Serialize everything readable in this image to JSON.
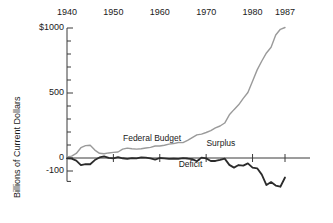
{
  "chart_data": {
    "type": "line",
    "title": "",
    "subtitle": "",
    "xlabel": "",
    "ylabel": "Billions of Current Dollars",
    "xlim": [
      1940,
      1987
    ],
    "ylim": [
      -180,
      1000
    ],
    "grid": false,
    "legend_position": "inline-annotations",
    "x_ticks": [
      {
        "value": 1940,
        "label": "1940"
      },
      {
        "value": 1950,
        "label": "1950"
      },
      {
        "value": 1960,
        "label": "1960"
      },
      {
        "value": 1970,
        "label": "1970"
      },
      {
        "value": 1980,
        "label": "1980"
      },
      {
        "value": 1987,
        "label": "1987"
      }
    ],
    "x_tick_side": "top",
    "y_ticks": [
      {
        "value": 1000,
        "label": "$1000",
        "major": true
      },
      {
        "value": 900,
        "label": "",
        "major": false
      },
      {
        "value": 800,
        "label": "",
        "major": false
      },
      {
        "value": 700,
        "label": "",
        "major": false
      },
      {
        "value": 600,
        "label": "",
        "major": false
      },
      {
        "value": 500,
        "label": "500",
        "major": true
      },
      {
        "value": 400,
        "label": "",
        "major": false
      },
      {
        "value": 300,
        "label": "",
        "major": false
      },
      {
        "value": 200,
        "label": "",
        "major": false
      },
      {
        "value": 100,
        "label": "",
        "major": false
      },
      {
        "value": 0,
        "label": "0",
        "major": true
      },
      {
        "value": -100,
        "label": "-100",
        "major": true
      },
      {
        "value": -180,
        "label": "",
        "major": false
      }
    ],
    "colors": {
      "federal_budget": "#9a9a9a",
      "surplus_deficit": "#2b2b2b",
      "axis": "#3a3a3a",
      "text": "#1a1a1a"
    },
    "annotations": [
      {
        "text": "Federal Budget",
        "x": 1952.5,
        "y": 150,
        "series": "federal_budget"
      },
      {
        "text": "Surplus",
        "x": 1970.5,
        "y": 105,
        "series": "surplus_deficit"
      },
      {
        "text": "Deficit",
        "x": 1964.5,
        "y": -55,
        "series": "surplus_deficit"
      }
    ],
    "series": [
      {
        "name": "Federal Budget",
        "color": "#9a9a9a",
        "x": [
          1940,
          1941,
          1942,
          1943,
          1944,
          1945,
          1946,
          1947,
          1948,
          1949,
          1950,
          1951,
          1952,
          1953,
          1954,
          1955,
          1956,
          1957,
          1958,
          1959,
          1960,
          1961,
          1962,
          1963,
          1964,
          1965,
          1966,
          1967,
          1968,
          1969,
          1970,
          1971,
          1972,
          1973,
          1974,
          1975,
          1976,
          1977,
          1978,
          1979,
          1980,
          1981,
          1982,
          1983,
          1984,
          1985,
          1986,
          1987
        ],
        "values": [
          9,
          14,
          35,
          79,
          95,
          98,
          61,
          36,
          33,
          39,
          43,
          46,
          68,
          76,
          71,
          68,
          71,
          77,
          82,
          92,
          92,
          98,
          107,
          111,
          119,
          118,
          135,
          157,
          178,
          184,
          196,
          210,
          231,
          246,
          269,
          332,
          372,
          409,
          459,
          504,
          591,
          678,
          746,
          808,
          852,
          946,
          990,
          1004
        ]
      },
      {
        "name": "Surplus / Deficit",
        "color": "#2b2b2b",
        "x": [
          1940,
          1941,
          1942,
          1943,
          1944,
          1945,
          1946,
          1947,
          1948,
          1949,
          1950,
          1951,
          1952,
          1953,
          1954,
          1955,
          1956,
          1957,
          1958,
          1959,
          1960,
          1961,
          1962,
          1963,
          1964,
          1965,
          1966,
          1967,
          1968,
          1969,
          1970,
          1971,
          1972,
          1973,
          1974,
          1975,
          1976,
          1977,
          1978,
          1979,
          1980,
          1981,
          1982,
          1983,
          1984,
          1985,
          1986,
          1987
        ],
        "values": [
          -3,
          -5,
          -20,
          -55,
          -48,
          -48,
          -16,
          4,
          12,
          1,
          -3,
          6,
          -2,
          -6,
          -1,
          -3,
          4,
          3,
          -3,
          -13,
          0,
          -3,
          -7,
          -5,
          -6,
          -1,
          -4,
          -9,
          -25,
          3,
          -3,
          -23,
          -23,
          -15,
          -5,
          -53,
          -74,
          -54,
          -59,
          -41,
          -74,
          -79,
          -128,
          -208,
          -185,
          -212,
          -221,
          -150
        ]
      }
    ]
  }
}
